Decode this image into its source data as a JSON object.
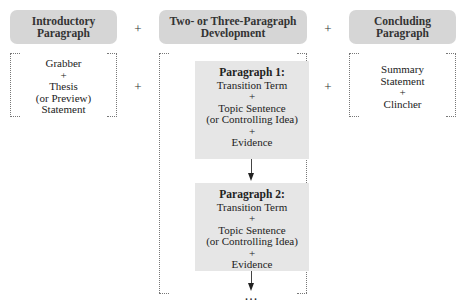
{
  "diagram": {
    "columns": [
      {
        "header": [
          "Introductory",
          "Paragraph"
        ],
        "content": [
          "Grabber",
          "+",
          "Thesis",
          "(or Preview)",
          "Statement"
        ]
      },
      {
        "header": [
          "Two- or Three-Paragraph",
          "Development"
        ],
        "paragraphs": [
          {
            "title": "Paragraph 1:",
            "lines": [
              "Transition Term",
              "+",
              "Topic Sentence",
              "(or Controlling Idea)",
              "+",
              "Evidence"
            ]
          },
          {
            "title": "Paragraph 2:",
            "lines": [
              "Transition Term",
              "+",
              "Topic Sentence",
              "(or Controlling Idea)",
              "+",
              "Evidence"
            ]
          }
        ],
        "continuation": "..."
      },
      {
        "header": [
          "Concluding",
          "Paragraph"
        ],
        "content": [
          "Summary",
          "Statement",
          "+",
          "Clincher"
        ]
      }
    ],
    "operator": "+",
    "colors": {
      "header_fill": "#d6d6d6",
      "paragraph_fill": "#e6e6e6",
      "bracket_line": "#777777",
      "text": "#222222"
    }
  }
}
